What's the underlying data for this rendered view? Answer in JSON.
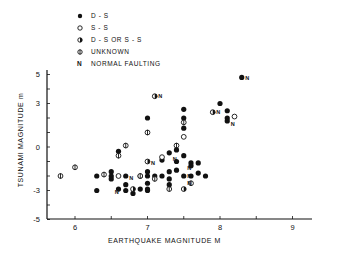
{
  "legend": {
    "items": [
      {
        "marker": "filled-circle",
        "label": "D - S"
      },
      {
        "marker": "open-circle",
        "label": "S - S"
      },
      {
        "marker": "half-filled-circle",
        "label": "D - S  OR  S - S"
      },
      {
        "marker": "crossed-circle",
        "label": "UNKNOWN"
      },
      {
        "marker": "N",
        "label": "NORMAL  FAULTING"
      }
    ]
  },
  "axes": {
    "xlabel": "EARTHQUAKE  MAGNITUDE  M",
    "ylabel": "TSUNAMI  MAGNITUDE  m"
  },
  "chart_data": {
    "type": "scatter",
    "title": "",
    "xlabel": "EARTHQUAKE MAGNITUDE M",
    "ylabel": "TSUNAMI MAGNITUDE m",
    "xlim": [
      5.6,
      9.3
    ],
    "ylim": [
      -5,
      5.5
    ],
    "x_ticks": [
      6,
      7,
      8,
      9
    ],
    "y_ticks": [
      5,
      3,
      0,
      -3,
      -5
    ],
    "grid": false,
    "legend_position": "top-left (above plot)",
    "series": [
      {
        "name": "D-S",
        "marker": "filled-circle",
        "points": [
          [
            6.3,
            -2.0
          ],
          [
            6.3,
            -3.0
          ],
          [
            6.5,
            -1.7
          ],
          [
            6.5,
            -2.0
          ],
          [
            6.5,
            -2.2
          ],
          [
            6.6,
            -2.9
          ],
          [
            6.6,
            -0.3
          ],
          [
            6.7,
            -2.0
          ],
          [
            6.7,
            -2.6
          ],
          [
            6.7,
            -3.0
          ],
          [
            6.8,
            -3.2
          ],
          [
            6.9,
            -2.0
          ],
          [
            6.9,
            -2.9
          ],
          [
            7.0,
            -2.0
          ],
          [
            7.0,
            -1.7
          ],
          [
            7.0,
            -2.5
          ],
          [
            7.0,
            -3.0
          ],
          [
            7.0,
            2.0
          ],
          [
            7.1,
            -2.0
          ],
          [
            7.2,
            -2.0
          ],
          [
            7.2,
            -0.9
          ],
          [
            7.3,
            -1.7
          ],
          [
            7.3,
            -2.2
          ],
          [
            7.4,
            -1.0
          ],
          [
            7.4,
            -1.6
          ],
          [
            7.5,
            -0.6
          ],
          [
            7.5,
            1.3
          ],
          [
            7.5,
            2.6
          ],
          [
            7.6,
            -1.1
          ],
          [
            7.6,
            -1.3
          ],
          [
            7.7,
            -1.1
          ],
          [
            7.7,
            -1.8
          ],
          [
            7.8,
            -2.0
          ],
          [
            7.6,
            -2.0
          ],
          [
            7.5,
            -2.0
          ],
          [
            7.3,
            -2.6
          ],
          [
            7.0,
            -2.9
          ],
          [
            8.0,
            3.0
          ],
          [
            8.1,
            2.5
          ],
          [
            8.1,
            2.0
          ],
          [
            8.1,
            1.8
          ],
          [
            8.3,
            4.8
          ],
          [
            7.5,
            2.0
          ],
          [
            7.3,
            -0.4
          ],
          [
            7.4,
            -0.2
          ]
        ]
      },
      {
        "name": "S-S",
        "marker": "open-circle",
        "points": [
          [
            6.6,
            -2.0
          ],
          [
            7.2,
            -0.7
          ],
          [
            7.5,
            0.7
          ],
          [
            8.2,
            2.1
          ]
        ]
      },
      {
        "name": "D-S or S-S",
        "marker": "half-filled-circle",
        "points": [
          [
            6.8,
            -2.9
          ],
          [
            7.1,
            3.5
          ],
          [
            7.0,
            -1.0
          ],
          [
            7.9,
            2.4
          ],
          [
            7.5,
            -2.9
          ]
        ]
      },
      {
        "name": "Unknown",
        "marker": "crossed-circle",
        "points": [
          [
            5.8,
            -2.0
          ],
          [
            6.0,
            -1.4
          ],
          [
            6.4,
            -1.9
          ],
          [
            6.6,
            -0.6
          ],
          [
            6.7,
            0.1
          ],
          [
            7.0,
            1.0
          ],
          [
            7.3,
            -2.9
          ],
          [
            7.4,
            0.1
          ],
          [
            7.5,
            1.7
          ],
          [
            6.9,
            -2.0
          ],
          [
            7.1,
            -2.2
          ],
          [
            7.6,
            -2.5
          ]
        ]
      },
      {
        "name": "Normal faulting (label N)",
        "marker": "N",
        "points": [
          [
            6.7,
            -2.1
          ],
          [
            6.5,
            -3.1
          ],
          [
            7.1,
            3.5
          ],
          [
            7.0,
            -1.1
          ],
          [
            7.5,
            -1.4
          ],
          [
            7.5,
            -2.0
          ],
          [
            7.5,
            -2.5
          ],
          [
            7.9,
            2.4
          ],
          [
            8.1,
            1.6
          ],
          [
            8.3,
            4.8
          ],
          [
            7.3,
            -0.8
          ]
        ]
      }
    ]
  }
}
